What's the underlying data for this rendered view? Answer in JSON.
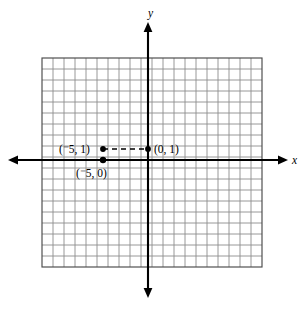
{
  "figure": {
    "background_color": "#ffffff",
    "grid_color": "#8d8d8d",
    "border_color": "#4a4a4a",
    "axis_color": "#000000"
  },
  "axes": {
    "x_label": "x",
    "y_label": "y",
    "x_axis_name": "x-axis",
    "y_axis_name": "y-axis",
    "origin_px": [
      148,
      160
    ],
    "cell_px": 11,
    "grid_columns": 20,
    "grid_rows": 19,
    "grid_left_px": 42,
    "grid_top_px": 58,
    "grid_right_px": 262,
    "grid_bottom_px": 267,
    "x_axis_y_px": 160,
    "y_axis_x_px": 148,
    "x_axis_start_px": 8,
    "x_axis_end_px": 288,
    "y_axis_start_px": 22,
    "y_axis_end_px": 298
  },
  "chart_data": {
    "type": "scatter",
    "title": "",
    "xlabel": "x",
    "ylabel": "y",
    "grid": true,
    "legend": "none",
    "xlim": [
      -10,
      10
    ],
    "ylim": [
      -10,
      9
    ],
    "points": [
      {
        "id": "point-neg5-1",
        "label": "(⁻5, 1)",
        "label_text_prefix": "(",
        "label_negative_sign": "⁻",
        "label_value": "5, 1)",
        "x": -5,
        "y": 1,
        "px": [
          103,
          149
        ],
        "label_px": [
          59,
          153
        ],
        "label_anchor": "start"
      },
      {
        "id": "point-0-1",
        "label": "(0, 1)",
        "x": 0,
        "y": 1,
        "px": [
          148,
          149
        ],
        "label_px": [
          154,
          153
        ],
        "label_anchor": "start"
      },
      {
        "id": "point-neg5-0",
        "label": "(⁻5, 0)",
        "label_text_prefix": "(",
        "label_negative_sign": "⁻",
        "label_value": "5, 0)",
        "x": -5,
        "y": 0,
        "px": [
          103,
          160
        ],
        "label_px": [
          76,
          177
        ],
        "label_anchor": "start"
      }
    ],
    "connectors": [
      {
        "id": "dashed-segment",
        "from": "point-neg5-1",
        "to": "point-0-1",
        "style": "dashed",
        "from_px": [
          103,
          149
        ],
        "to_px": [
          148,
          149
        ]
      }
    ]
  }
}
